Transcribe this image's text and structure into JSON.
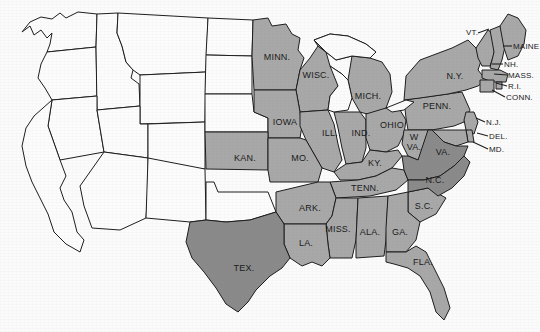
{
  "map": {
    "title": "United States shaded state map",
    "background_color": "#fbfbfb",
    "outline_color": "#1d1d1d",
    "shade_levels": {
      "unshaded": "#fcfcfc",
      "medium": "#a8a8a8",
      "dark": "#8a8a8a"
    },
    "labels": [
      {
        "id": "minn",
        "text": "MINN.",
        "x": 277,
        "y": 57,
        "shade": "medium",
        "leader": false
      },
      {
        "id": "wisc",
        "text": "WISC.",
        "x": 316,
        "y": 75,
        "shade": "medium",
        "leader": false
      },
      {
        "id": "mich",
        "text": "MICH.",
        "x": 368,
        "y": 96,
        "shade": "medium",
        "leader": false
      },
      {
        "id": "iowa",
        "text": "IOWA",
        "x": 285,
        "y": 122,
        "shade": "medium",
        "leader": false
      },
      {
        "id": "ill",
        "text": "ILL.",
        "x": 330,
        "y": 133,
        "shade": "medium",
        "leader": false
      },
      {
        "id": "ind",
        "text": "IND.",
        "x": 361,
        "y": 133,
        "shade": "medium",
        "leader": false
      },
      {
        "id": "ohio",
        "text": "OHIO",
        "x": 392,
        "y": 125,
        "shade": "medium",
        "leader": false
      },
      {
        "id": "penn",
        "text": "PENN.",
        "x": 437,
        "y": 106,
        "shade": "medium",
        "leader": false
      },
      {
        "id": "ny",
        "text": "N.Y.",
        "x": 455,
        "y": 76,
        "shade": "medium",
        "leader": false
      },
      {
        "id": "kan",
        "text": "KAN.",
        "x": 245,
        "y": 158,
        "shade": "medium",
        "leader": false
      },
      {
        "id": "mo",
        "text": "MO.",
        "x": 300,
        "y": 158,
        "shade": "medium",
        "leader": false
      },
      {
        "id": "ky",
        "text": "KY.",
        "x": 375,
        "y": 163,
        "shade": "medium",
        "leader": false
      },
      {
        "id": "wva",
        "text": "W",
        "x": 414,
        "y": 137,
        "shade": "medium",
        "leader": false
      },
      {
        "id": "wva2",
        "text": "VA.",
        "x": 414,
        "y": 147,
        "shade": "medium",
        "leader": false
      },
      {
        "id": "va",
        "text": "VA.",
        "x": 443,
        "y": 152,
        "shade": "dark",
        "leader": false
      },
      {
        "id": "ark",
        "text": "ARK.",
        "x": 310,
        "y": 208,
        "shade": "medium",
        "leader": false
      },
      {
        "id": "tenn",
        "text": "TENN.",
        "x": 365,
        "y": 188,
        "shade": "medium",
        "leader": false
      },
      {
        "id": "nc",
        "text": "N.C.",
        "x": 435,
        "y": 180,
        "shade": "dark",
        "leader": false
      },
      {
        "id": "sc",
        "text": "S.C.",
        "x": 424,
        "y": 206,
        "shade": "medium",
        "leader": false
      },
      {
        "id": "miss",
        "text": "MISS.",
        "x": 338,
        "y": 229,
        "shade": "medium",
        "leader": false
      },
      {
        "id": "ala",
        "text": "ALA.",
        "x": 370,
        "y": 232,
        "shade": "medium",
        "leader": false
      },
      {
        "id": "ga",
        "text": "GA.",
        "x": 400,
        "y": 232,
        "shade": "medium",
        "leader": false
      },
      {
        "id": "la",
        "text": "LA.",
        "x": 306,
        "y": 243,
        "shade": "medium",
        "leader": false
      },
      {
        "id": "fla",
        "text": "FLA.",
        "x": 423,
        "y": 262,
        "shade": "medium",
        "leader": false
      },
      {
        "id": "tex",
        "text": "TEX.",
        "x": 244,
        "y": 268,
        "shade": "dark",
        "leader": false
      }
    ],
    "leader_labels": [
      {
        "id": "vt",
        "text": "VT.",
        "x": 466,
        "y": 32,
        "line": [
          [
            478,
            33
          ],
          [
            489,
            29
          ]
        ]
      },
      {
        "id": "maine",
        "text": "MAINE",
        "x": 513,
        "y": 46,
        "line": [
          [
            512,
            46
          ],
          [
            503,
            46
          ]
        ]
      },
      {
        "id": "nh",
        "text": "NH.",
        "x": 504,
        "y": 64,
        "line": [
          [
            503,
            64
          ],
          [
            492,
            64
          ]
        ]
      },
      {
        "id": "mass",
        "text": "MASS.",
        "x": 508,
        "y": 75,
        "line": [
          [
            507,
            75
          ],
          [
            494,
            74
          ]
        ]
      },
      {
        "id": "ri",
        "text": "R.I.",
        "x": 508,
        "y": 86,
        "line": [
          [
            507,
            86
          ],
          [
            496,
            83
          ]
        ]
      },
      {
        "id": "conn",
        "text": "CONN.",
        "x": 506,
        "y": 97,
        "line": [
          [
            505,
            97
          ],
          [
            492,
            90
          ]
        ]
      },
      {
        "id": "nj",
        "text": "N.J.",
        "x": 486,
        "y": 122,
        "line": [
          [
            485,
            122
          ],
          [
            476,
            118
          ]
        ]
      },
      {
        "id": "del",
        "text": "DEL.",
        "x": 489,
        "y": 136,
        "line": [
          [
            488,
            136
          ],
          [
            477,
            133
          ]
        ]
      },
      {
        "id": "md",
        "text": "MD.",
        "x": 489,
        "y": 149,
        "line": [
          [
            488,
            149
          ],
          [
            473,
            142
          ]
        ]
      }
    ]
  }
}
